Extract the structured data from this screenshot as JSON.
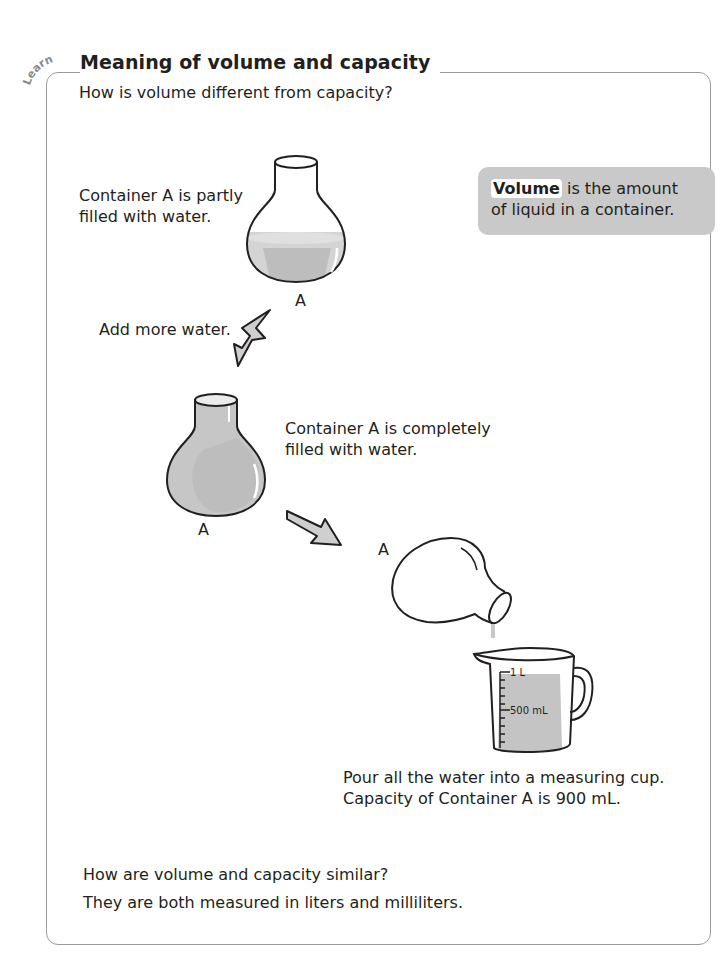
{
  "section": {
    "tag": "Learn",
    "title": "Meaning of volume and capacity",
    "question": "How is volume different from capacity?"
  },
  "definition": {
    "term": "Volume",
    "rest_line1": " is the amount",
    "line2": "of liquid in a container.",
    "box_color": "#c9c9c9"
  },
  "steps": {
    "partly_line1": "Container A is partly",
    "partly_line2": "filled with water.",
    "container_label": "A",
    "add_water": "Add more water.",
    "complete_line1": "Container A is completely",
    "complete_line2": "filled with water.",
    "pour_line1": "Pour all the water into a measuring cup.",
    "pour_line2": "Capacity of Container A is 900 mL."
  },
  "measuring_cup": {
    "mark_top": "1 L",
    "mark_mid": "500 mL"
  },
  "summary": {
    "question": "How are volume and capacity similar?",
    "answer": "They are both measured in liters and milliliters."
  },
  "colors": {
    "water": "#c8c8c8",
    "water_dark": "#b4b4b4",
    "outline": "#231f20",
    "frame": "#9b9b9b"
  }
}
